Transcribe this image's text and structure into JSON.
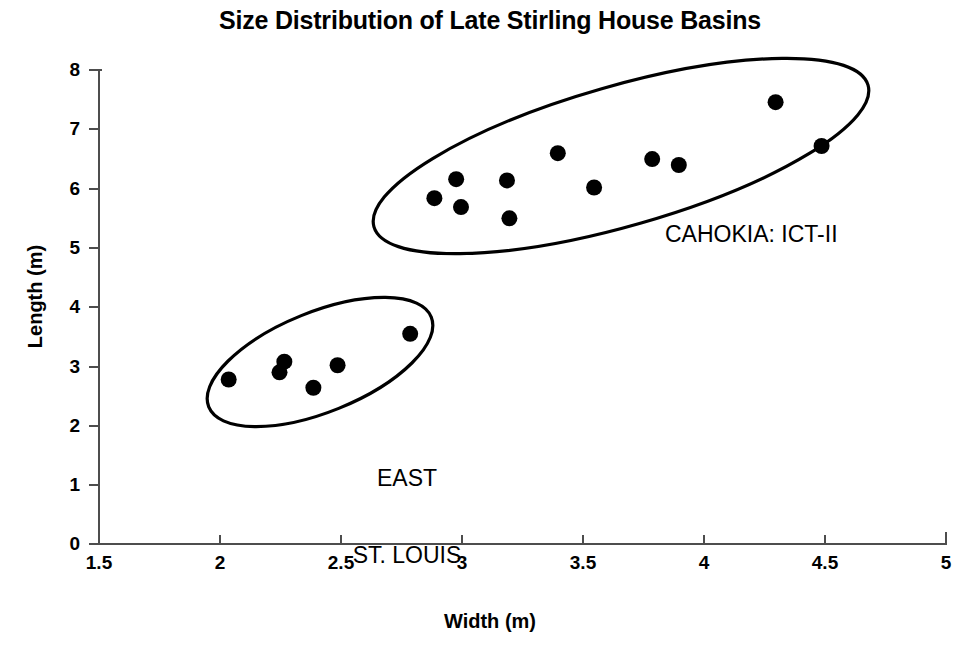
{
  "chart_data": {
    "type": "scatter",
    "title": "Size Distribution of Late Stirling House Basins",
    "xlabel": "Width (m)",
    "ylabel": "Length (m)",
    "xlim": [
      1.5,
      5
    ],
    "ylim": [
      0,
      8
    ],
    "xticks": [
      "1.5",
      "2",
      "2.5",
      "3",
      "3.5",
      "4",
      "4.5",
      "5"
    ],
    "xtick_values": [
      1.5,
      2,
      2.5,
      3,
      3.5,
      4,
      4.5,
      5
    ],
    "yticks": [
      "0",
      "1",
      "2",
      "3",
      "4",
      "5",
      "6",
      "7",
      "8"
    ],
    "ytick_values": [
      0,
      1,
      2,
      3,
      4,
      5,
      6,
      7,
      8
    ],
    "grid": false,
    "legend": "none",
    "marker": "filled-circle",
    "marker_color": "#000000",
    "series": [
      {
        "name": "CAHOKIA: ICT-II",
        "annotation": "CAHOKIA: ICT-II",
        "points": [
          {
            "x": 2.89,
            "y": 5.82
          },
          {
            "x": 2.98,
            "y": 6.14
          },
          {
            "x": 3.0,
            "y": 5.67
          },
          {
            "x": 3.19,
            "y": 6.12
          },
          {
            "x": 3.2,
            "y": 5.48
          },
          {
            "x": 3.4,
            "y": 6.58
          },
          {
            "x": 3.55,
            "y": 6.0
          },
          {
            "x": 3.79,
            "y": 6.48
          },
          {
            "x": 3.9,
            "y": 6.38
          },
          {
            "x": 4.3,
            "y": 7.44
          },
          {
            "x": 4.49,
            "y": 6.7
          }
        ]
      },
      {
        "name": "EAST ST. LOUIS",
        "annotation": "EAST\nST. LOUIS",
        "points": [
          {
            "x": 2.04,
            "y": 2.76
          },
          {
            "x": 2.27,
            "y": 3.06
          },
          {
            "x": 2.25,
            "y": 2.88
          },
          {
            "x": 2.39,
            "y": 2.62
          },
          {
            "x": 2.49,
            "y": 3.0
          },
          {
            "x": 2.79,
            "y": 3.53
          }
        ]
      }
    ],
    "annotations": [
      {
        "text": "CAHOKIA: ICT-II",
        "x": 3.85,
        "y": 5.1
      },
      {
        "text": "EAST",
        "x": 2.45,
        "y": 4.0
      },
      {
        "text": "ST. LOUIS",
        "x": 2.45,
        "y": 3.55
      }
    ],
    "enclosures": [
      {
        "label": "CAHOKIA: ICT-II",
        "shape": "ellipse"
      },
      {
        "label": "EAST ST. LOUIS",
        "shape": "ellipse"
      }
    ]
  },
  "labels": {
    "cluster_cahokia": "CAHOKIA: ICT-II",
    "cluster_east_line1": "EAST",
    "cluster_east_line2": "ST. LOUIS"
  },
  "colors": {
    "background": "#ffffff",
    "ink": "#000000",
    "axis": "#4d4d4d"
  }
}
